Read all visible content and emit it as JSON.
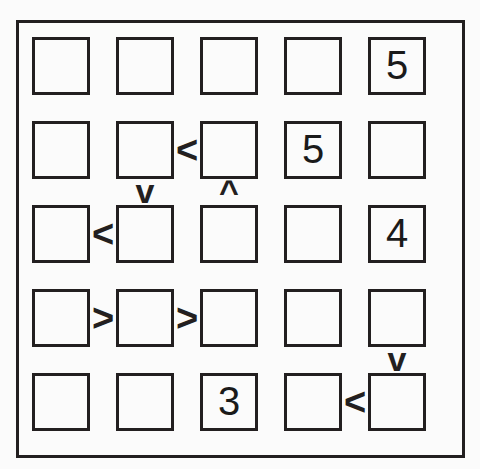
{
  "puzzle": {
    "type": "futoshiki",
    "size": 5,
    "rows": 5,
    "cols": 5,
    "background_color": "#fbfbfb",
    "line_color": "#231f20",
    "frame": {
      "x": 16,
      "y": 20,
      "width": 449,
      "height": 438,
      "stroke": 3
    },
    "cell_metrics": {
      "size": 58,
      "step_x": 84,
      "step_y": 84,
      "origin_x": 13,
      "origin_y": 14,
      "stroke": 3
    },
    "cells": [
      [
        {
          "row": 1,
          "col": 1,
          "value": ""
        },
        {
          "row": 1,
          "col": 2,
          "value": ""
        },
        {
          "row": 1,
          "col": 3,
          "value": ""
        },
        {
          "row": 1,
          "col": 4,
          "value": ""
        },
        {
          "row": 1,
          "col": 5,
          "value": "5"
        }
      ],
      [
        {
          "row": 2,
          "col": 1,
          "value": ""
        },
        {
          "row": 2,
          "col": 2,
          "value": ""
        },
        {
          "row": 2,
          "col": 3,
          "value": ""
        },
        {
          "row": 2,
          "col": 4,
          "value": "5"
        },
        {
          "row": 2,
          "col": 5,
          "value": ""
        }
      ],
      [
        {
          "row": 3,
          "col": 1,
          "value": ""
        },
        {
          "row": 3,
          "col": 2,
          "value": ""
        },
        {
          "row": 3,
          "col": 3,
          "value": ""
        },
        {
          "row": 3,
          "col": 4,
          "value": ""
        },
        {
          "row": 3,
          "col": 5,
          "value": "4"
        }
      ],
      [
        {
          "row": 4,
          "col": 1,
          "value": ""
        },
        {
          "row": 4,
          "col": 2,
          "value": ""
        },
        {
          "row": 4,
          "col": 3,
          "value": ""
        },
        {
          "row": 4,
          "col": 4,
          "value": ""
        },
        {
          "row": 4,
          "col": 5,
          "value": ""
        }
      ],
      [
        {
          "row": 5,
          "col": 1,
          "value": ""
        },
        {
          "row": 5,
          "col": 2,
          "value": ""
        },
        {
          "row": 5,
          "col": 3,
          "value": "3"
        },
        {
          "row": 5,
          "col": 4,
          "value": ""
        },
        {
          "row": 5,
          "col": 5,
          "value": ""
        }
      ]
    ],
    "horizontal_constraints": [
      {
        "row": 2,
        "left_col": 2,
        "right_col": 3,
        "symbol": "<"
      },
      {
        "row": 3,
        "left_col": 1,
        "right_col": 2,
        "symbol": "<"
      },
      {
        "row": 4,
        "left_col": 1,
        "right_col": 2,
        "symbol": ">"
      },
      {
        "row": 4,
        "left_col": 2,
        "right_col": 3,
        "symbol": ">"
      },
      {
        "row": 5,
        "left_col": 4,
        "right_col": 5,
        "symbol": "<"
      }
    ],
    "vertical_constraints": [
      {
        "col": 2,
        "top_row": 2,
        "bottom_row": 3,
        "symbol": "v"
      },
      {
        "col": 3,
        "top_row": 2,
        "bottom_row": 3,
        "symbol": "^"
      },
      {
        "col": 5,
        "top_row": 4,
        "bottom_row": 5,
        "symbol": "v"
      }
    ]
  }
}
